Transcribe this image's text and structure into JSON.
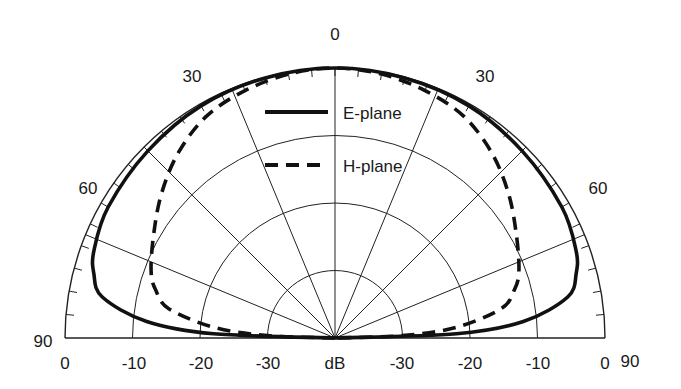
{
  "chart_data": {
    "type": "line",
    "subtype": "polar-half",
    "title": "",
    "radial_unit_label": "dB",
    "radial_ticks": [
      0,
      -10,
      -20,
      -30
    ],
    "radial_range": [
      -40,
      0
    ],
    "angle_ticks": [
      0,
      30,
      60,
      90
    ],
    "angle_ticks_display": [
      "0",
      "30",
      "30",
      "60",
      "60",
      "90",
      "90"
    ],
    "bottom_axis_labels": [
      "0",
      "-10",
      "-20",
      "-30",
      "dB",
      "-30",
      "-20",
      "-10",
      "0"
    ],
    "grid": true,
    "legend_position": "upper center",
    "series": [
      {
        "name": "E-plane",
        "style": "solid",
        "angles_deg": [
          0,
          15,
          30,
          45,
          60,
          70,
          75,
          80,
          85,
          88,
          90
        ],
        "values_db": [
          0,
          -0.1,
          -0.3,
          -0.8,
          -1.2,
          -2,
          -3,
          -5,
          -12,
          -22,
          -40
        ]
      },
      {
        "name": "H-plane",
        "style": "dashed",
        "angles_deg": [
          0,
          10,
          20,
          30,
          40,
          50,
          60,
          70,
          75,
          80,
          85,
          88,
          90
        ],
        "values_db": [
          0,
          -0.3,
          -1,
          -2,
          -4,
          -6.5,
          -9,
          -11,
          -12.5,
          -15,
          -22,
          -30,
          -40
        ]
      }
    ]
  },
  "legend": {
    "items": [
      {
        "label": "E-plane",
        "style": "solid"
      },
      {
        "label": "H-plane",
        "style": "dashed"
      }
    ]
  }
}
